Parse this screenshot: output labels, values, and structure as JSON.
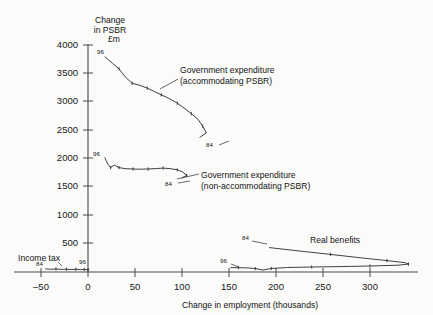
{
  "chart_data": {
    "type": "line",
    "title": "",
    "xlabel": "Change in employment (thousands)",
    "ylabel_lines": [
      "Change",
      "in PSBR",
      "£m"
    ],
    "xlim": [
      -60,
      350
    ],
    "ylim": [
      0,
      4100
    ],
    "xticks": [
      -50,
      0,
      50,
      100,
      150,
      200,
      250,
      300
    ],
    "xtick_labels": [
      "–50",
      "0",
      "50",
      "100",
      "150",
      "200",
      "250",
      "300"
    ],
    "yticks": [
      500,
      1000,
      1500,
      2000,
      2500,
      3000,
      3500,
      4000
    ],
    "ytick_labels": [
      "500",
      "1000",
      "1500",
      "2000",
      "2500",
      "3000",
      "3500",
      "4000"
    ],
    "grid": false,
    "legend": "inline-annotations",
    "series": [
      {
        "name": "Government expenditure (accommodating PSBR)",
        "label_lines": [
          "Government expenditure",
          "(accommodating PSBR)"
        ],
        "start_label": "96",
        "end_label": "84",
        "points": [
          [
            18,
            3790
          ],
          [
            26,
            3680
          ],
          [
            33,
            3580
          ],
          [
            40,
            3430
          ],
          [
            47,
            3325
          ],
          [
            55,
            3290
          ],
          [
            63,
            3240
          ],
          [
            70,
            3185
          ],
          [
            78,
            3120
          ],
          [
            86,
            3060
          ],
          [
            95,
            2975
          ],
          [
            103,
            2880
          ],
          [
            110,
            2790
          ],
          [
            117,
            2690
          ],
          [
            122,
            2570
          ],
          [
            126,
            2450
          ],
          [
            119,
            2375
          ]
        ]
      },
      {
        "name": "Government expenditure (non-accommodating PSBR)",
        "label_lines": [
          "Government expenditure",
          "(non-accommodating PSBR)"
        ],
        "start_label": "96",
        "end_label": "84",
        "points": [
          [
            18,
            2010
          ],
          [
            21,
            1905
          ],
          [
            24,
            1840
          ],
          [
            28,
            1885
          ],
          [
            33,
            1840
          ],
          [
            40,
            1820
          ],
          [
            48,
            1815
          ],
          [
            56,
            1812
          ],
          [
            64,
            1815
          ],
          [
            72,
            1822
          ],
          [
            80,
            1830
          ],
          [
            88,
            1820
          ],
          [
            95,
            1800
          ],
          [
            101,
            1760
          ],
          [
            105,
            1700
          ],
          [
            100,
            1660
          ]
        ]
      },
      {
        "name": "Real benefits",
        "label_lines": [
          "Real benefits"
        ],
        "start_label": "84",
        "end_label": "96",
        "points": [
          [
            193,
            430
          ],
          [
            225,
            370
          ],
          [
            258,
            310
          ],
          [
            290,
            250
          ],
          [
            318,
            200
          ],
          [
            337,
            165
          ],
          [
            341,
            140
          ],
          [
            330,
            120
          ],
          [
            300,
            105
          ],
          [
            268,
            95
          ],
          [
            238,
            88
          ],
          [
            212,
            80
          ],
          [
            195,
            62
          ],
          [
            186,
            35
          ],
          [
            178,
            60
          ],
          [
            170,
            72
          ],
          [
            160,
            75
          ],
          [
            152,
            78
          ]
        ]
      },
      {
        "name": "Income tax",
        "label_lines": [
          "Income tax"
        ],
        "start_label": "84",
        "end_label": "96",
        "points": [
          [
            -45,
            55
          ],
          [
            -40,
            48
          ],
          [
            -34,
            52
          ],
          [
            -28,
            46
          ],
          [
            -23,
            50
          ],
          [
            -18,
            44
          ],
          [
            -13,
            48
          ],
          [
            -8,
            42
          ],
          [
            -4,
            46
          ],
          [
            -1,
            40
          ],
          [
            1,
            44
          ]
        ]
      }
    ],
    "annotations": [
      {
        "name": "accommodating-label",
        "text": "Government expenditure (accommodating PSBR)"
      },
      {
        "name": "non-accommodating-label",
        "text": "Government expenditure (non-accommodating PSBR)"
      },
      {
        "name": "real-benefits-label",
        "text": "Real benefits"
      },
      {
        "name": "income-tax-label",
        "text": "Income tax"
      }
    ]
  },
  "labels": {
    "ylabel_1": "Change",
    "ylabel_2": "in PSBR",
    "ylabel_3": "£m",
    "xlabel": "Change in employment (thousands)",
    "y_4000": "4000",
    "y_3500": "3500",
    "y_3000": "3000",
    "y_2500": "2500",
    "y_2000": "2000",
    "y_1500": "1500",
    "y_1000": "1000",
    "y_500": "500",
    "x_m50": "–50",
    "x_0": "0",
    "x_50": "50",
    "x_100": "100",
    "x_150": "150",
    "x_200": "200",
    "x_250": "250",
    "x_300": "300",
    "gov_acc_1": "Government expenditure",
    "gov_acc_2": "(accommodating PSBR)",
    "gov_non_1": "Government expenditure",
    "gov_non_2": "(non-accommodating PSBR)",
    "real_benefits": "Real benefits",
    "income_tax": "Income tax",
    "p_acc_start": "96",
    "p_acc_end": "84",
    "p_non_start": "96",
    "p_non_end": "84",
    "p_rb_start": "84",
    "p_rb_end": "96",
    "p_it_start": "84",
    "p_it_end": "96"
  }
}
